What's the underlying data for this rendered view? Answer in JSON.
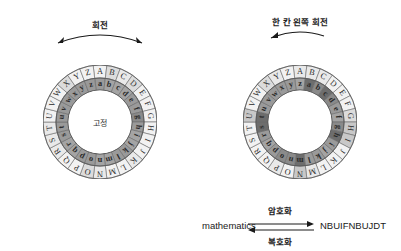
{
  "figure": {
    "alphabet_outer": [
      "A",
      "B",
      "C",
      "D",
      "E",
      "F",
      "G",
      "H",
      "I",
      "J",
      "K",
      "L",
      "M",
      "N",
      "O",
      "P",
      "Q",
      "R",
      "S",
      "T",
      "U",
      "V",
      "W",
      "X",
      "Y",
      "Z"
    ],
    "alphabet_inner": [
      "a",
      "b",
      "c",
      "d",
      "e",
      "f",
      "g",
      "h",
      "i",
      "j",
      "k",
      "l",
      "m",
      "n",
      "o",
      "p",
      "q",
      "r",
      "s",
      "t",
      "u",
      "v",
      "w",
      "x",
      "y",
      "z"
    ]
  },
  "left_disk": {
    "name": "unshifted-disk",
    "top_label": "회전",
    "center_label": "고정",
    "arrow_type": "double-headed-arc",
    "inner_shift": 0,
    "outer_start_letter": "A",
    "inner_start_letter": "a",
    "highlighted_inner": [],
    "highlighted_outer": []
  },
  "right_disk": {
    "name": "shifted-disk",
    "top_label": "한 칸 왼쪽 회전",
    "center_label": "",
    "arrow_type": "single-left-arc",
    "inner_shift": 1,
    "outer_start_letter": "A",
    "inner_start_letter": "z",
    "highlighted_inner": [
      "m",
      "h",
      "t",
      "c",
      "s",
      "a"
    ],
    "highlighted_outer": [
      "U",
      "H",
      "I",
      "N"
    ]
  },
  "equation": {
    "plaintext": "mathematics",
    "ciphertext": "NBUIFNBUJDT",
    "encrypt_label": "암호화",
    "decrypt_label": "복호화"
  },
  "colors": {
    "outer_ring_fill": "#f2f2f2",
    "inner_ring_fill": "#9a9a9a",
    "inner_ring_fill_alt": "#8a8a8a",
    "highlight_dark": "#6d6d6d",
    "highlight_light": "#c8c8c8",
    "stroke": "#6a6a6a",
    "background": "#ffffff",
    "text": "#2b2b2b"
  },
  "geometry": {
    "left_center_x": 100,
    "left_center_y": 122,
    "right_center_x": 300,
    "right_center_y": 122,
    "r_outer": 57,
    "r_mid": 44,
    "r_inner": 32,
    "sectors": 26
  }
}
